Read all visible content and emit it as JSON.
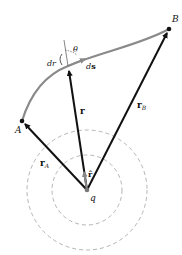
{
  "diagram": {
    "points": {
      "A": {
        "label": "A"
      },
      "B": {
        "label": "B"
      },
      "q": {
        "label": "q"
      }
    },
    "vectors": {
      "r": {
        "label": "r"
      },
      "rA": {
        "label": "r",
        "sub": "A"
      },
      "rB": {
        "label": "r",
        "sub": "B"
      },
      "rhat": {
        "label": "r̂"
      }
    },
    "annotations": {
      "theta": "θ",
      "dr": "dr",
      "ds_d": "d",
      "ds_s": "s"
    },
    "colors": {
      "path": "#8a8a8a",
      "vector": "#111111",
      "circle": "#b0b0b0",
      "unit_vector": "#888888"
    }
  }
}
